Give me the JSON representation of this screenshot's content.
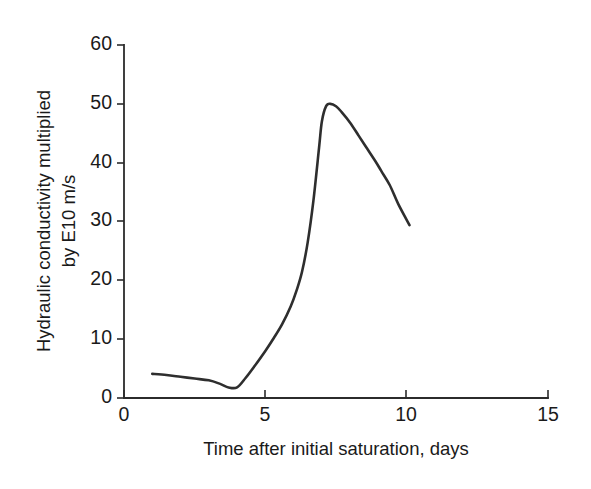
{
  "chart_data": {
    "type": "line",
    "title": "",
    "xlabel": "Time after initial saturation, days",
    "ylabel_line1": "Hydraulic conductivity multiplied",
    "ylabel_line2": "by E10 m/s",
    "ylabel": "Hydraulic conductivity multiplied by E10 m/s",
    "xlim": [
      0,
      15
    ],
    "ylim": [
      0,
      60
    ],
    "xticks": [
      0,
      5,
      10,
      15
    ],
    "xtick_labels": [
      "0",
      "5",
      "10",
      "15"
    ],
    "yticks": [
      0,
      10,
      20,
      30,
      40,
      50,
      60
    ],
    "ytick_labels": [
      "0",
      "10",
      "20",
      "30",
      "40",
      "50",
      "60"
    ],
    "grid": false,
    "legend": "none",
    "line_color": "#2e2e2e",
    "axis_color": "#2b2b2b",
    "background_color": "#ffffff",
    "series": [
      {
        "name": "Hydraulic conductivity",
        "x": [
          1.0,
          1.5,
          2.0,
          2.5,
          3.0,
          3.4,
          3.7,
          4.0,
          4.3,
          4.6,
          5.0,
          5.3,
          5.6,
          5.9,
          6.1,
          6.3,
          6.5,
          6.7,
          6.9,
          7.0,
          7.15,
          7.3,
          7.5,
          7.7,
          8.0,
          8.3,
          8.6,
          8.9,
          9.1,
          9.4,
          9.7,
          10.1
        ],
        "y": [
          4.1,
          3.9,
          3.6,
          3.3,
          3.0,
          2.4,
          1.8,
          1.8,
          3.4,
          5.3,
          8.0,
          10.2,
          12.6,
          15.6,
          18.2,
          21.5,
          26.5,
          33.5,
          42.5,
          47.0,
          49.6,
          50.0,
          49.6,
          48.6,
          46.8,
          44.6,
          42.4,
          40.2,
          38.6,
          36.2,
          33.0,
          29.4
        ]
      }
    ],
    "annotations": {
      "peak_x": 7.3,
      "peak_y": 50.0,
      "minimum_x": 3.8,
      "minimum_y": 1.8,
      "start_x": 1.0,
      "start_y": 4.1,
      "end_x": 10.1,
      "end_y": 29.4
    }
  },
  "figure": {
    "plot_left_px": 124,
    "plot_right_px": 548,
    "plot_bottom_px": 398,
    "plot_top_px": 45
  }
}
